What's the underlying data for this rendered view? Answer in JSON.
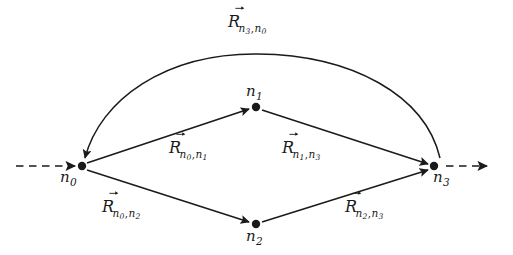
{
  "figure": {
    "kind": "directed-graph-diagram",
    "background_color": "#ffffff",
    "ink_color": "#1a1a1a",
    "width": 513,
    "height": 255
  },
  "nodes": [
    {
      "id": "n0",
      "label_base": "n",
      "label_sub": "0",
      "x": 82,
      "y": 166,
      "label_x": 60,
      "label_y": 170,
      "radius": 4.2
    },
    {
      "id": "n1",
      "label_base": "n",
      "label_sub": "1",
      "x": 256,
      "y": 107,
      "label_x": 243,
      "label_y": 84,
      "radius": 4.2
    },
    {
      "id": "n2",
      "label_base": "n",
      "label_sub": "2",
      "x": 256,
      "y": 224,
      "label_x": 243,
      "label_y": 229,
      "radius": 4.2
    },
    {
      "id": "n3",
      "label_base": "n",
      "label_sub": "3",
      "x": 434,
      "y": 166,
      "label_x": 433,
      "label_y": 170,
      "radius": 4.2
    }
  ],
  "edges": [
    {
      "id": "e-n0-n1",
      "from": "n0",
      "to": "n1",
      "style": "solid-straight",
      "label": {
        "base": "R",
        "accent": "vector-arrow",
        "sub1": "n",
        "sub1sub": "0",
        "sub2": "n",
        "sub2sub": "1"
      },
      "label_x": 169,
      "label_y": 140
    },
    {
      "id": "e-n1-n3",
      "from": "n1",
      "to": "n3",
      "style": "solid-straight",
      "label": {
        "base": "R",
        "accent": "vector-arrow",
        "sub1": "n",
        "sub1sub": "1",
        "sub2": "n",
        "sub2sub": "3"
      },
      "label_x": 282,
      "label_y": 140
    },
    {
      "id": "e-n0-n2",
      "from": "n0",
      "to": "n2",
      "style": "solid-straight",
      "label": {
        "base": "R",
        "accent": "vector-arrow",
        "sub1": "n",
        "sub1sub": "0",
        "sub2": "n",
        "sub2sub": "2"
      },
      "label_x": 102,
      "label_y": 199
    },
    {
      "id": "e-n2-n3",
      "from": "n2",
      "to": "n3",
      "style": "solid-straight",
      "label": {
        "base": "R",
        "accent": "vector-arrow",
        "sub1": "n",
        "sub1sub": "2",
        "sub2": "n",
        "sub2sub": "3"
      },
      "label_x": 345,
      "label_y": 199
    },
    {
      "id": "e-n3-n0",
      "from": "n3",
      "to": "n0",
      "style": "solid-arc-over-top",
      "label": {
        "base": "R",
        "accent": "vector-arrow",
        "sub1": "n",
        "sub1sub": "3",
        "sub2": "n",
        "sub2sub": "0"
      },
      "label_x": 228,
      "label_y": 14
    }
  ],
  "open_connectors": [
    {
      "id": "incoming-left",
      "style": "dashed",
      "direction": "into-n0",
      "x_start": 16,
      "x_end": 78,
      "y": 166
    },
    {
      "id": "outgoing-right",
      "style": "dashed",
      "direction": "away-from-n3",
      "x_start": 444,
      "x_end": 492,
      "y": 166
    }
  ]
}
